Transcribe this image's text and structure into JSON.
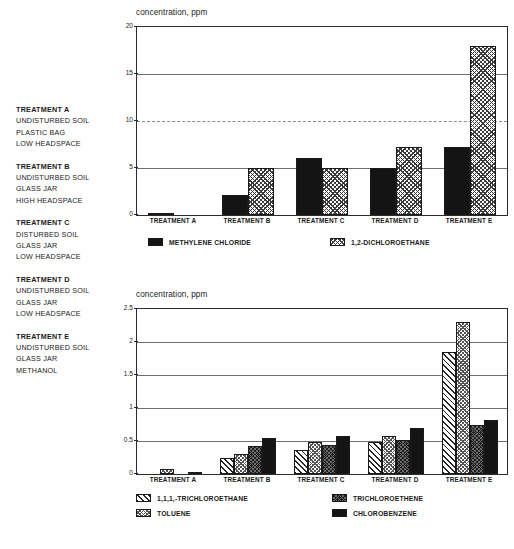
{
  "treatment_key": {
    "blocks": [
      {
        "title": "TREATMENT A",
        "lines": [
          "UNDISTURBED SOIL",
          "PLASTIC BAG",
          "LOW HEADSPACE"
        ]
      },
      {
        "title": "TREATMENT B",
        "lines": [
          "UNDISTURBED SOIL",
          "GLASS JAR",
          "HIGH HEADSPACE"
        ]
      },
      {
        "title": "TREATMENT C",
        "lines": [
          "DISTURBED SOIL",
          "GLASS JAR",
          "LOW HEADSPACE"
        ]
      },
      {
        "title": "TREATMENT D",
        "lines": [
          "UNDISTURBED SOIL",
          "GLASS JAR",
          "LOW HEADSPACE"
        ]
      },
      {
        "title": "TREATMENT E",
        "lines": [
          "UNDISTURBED SOIL",
          "GLASS JAR",
          "METHANOL"
        ]
      }
    ]
  },
  "chart_data": [
    {
      "type": "bar",
      "title": "concentration, ppm",
      "xlabel": "",
      "ylabel": "concentration, ppm",
      "ylim": [
        0,
        20
      ],
      "yticks": [
        0,
        5,
        10,
        15,
        20
      ],
      "ytick_labels": [
        "0",
        "5",
        "10",
        "15",
        "20"
      ],
      "grid": true,
      "legend_position": "bottom",
      "categories": [
        "TREATMENT A",
        "TREATMENT B",
        "TREATMENT C",
        "TREATMENT D",
        "TREATMENT E"
      ],
      "series": [
        {
          "name": "METHYLENE CHLORIDE",
          "pattern": "solid",
          "values": [
            0.1,
            2.1,
            6.1,
            5.0,
            7.2
          ]
        },
        {
          "name": "1,2-DICHLOROETHANE",
          "pattern": "cross",
          "values": [
            0.05,
            5.0,
            5.0,
            7.2,
            18.0
          ]
        }
      ]
    },
    {
      "type": "bar",
      "title": "concentration, ppm",
      "xlabel": "",
      "ylabel": "concentration, ppm",
      "ylim": [
        0,
        2.5
      ],
      "yticks": [
        0,
        0.5,
        1,
        1.5,
        2,
        2.5
      ],
      "ytick_labels": [
        "0",
        "0.5",
        "1",
        "1.5",
        "2",
        "2.5"
      ],
      "grid": true,
      "legend_position": "bottom",
      "categories": [
        "TREATMENT A",
        "TREATMENT B",
        "TREATMENT C",
        "TREATMENT D",
        "TREATMENT E"
      ],
      "series": [
        {
          "name": "1,1,1,-TRICHLOROETHANE",
          "pattern": "diag",
          "values": [
            0.0,
            0.25,
            0.37,
            0.49,
            1.85
          ]
        },
        {
          "name": "TOLUENE",
          "pattern": "dots",
          "values": [
            0.07,
            0.31,
            0.48,
            0.57,
            2.3
          ]
        },
        {
          "name": "TRICHLOROETHENE",
          "pattern": "darkcross",
          "values": [
            0.0,
            0.42,
            0.44,
            0.52,
            0.75
          ]
        },
        {
          "name": "CHLOROBENZENE",
          "pattern": "solid",
          "values": [
            0.01,
            0.55,
            0.58,
            0.7,
            0.82
          ]
        }
      ]
    }
  ]
}
